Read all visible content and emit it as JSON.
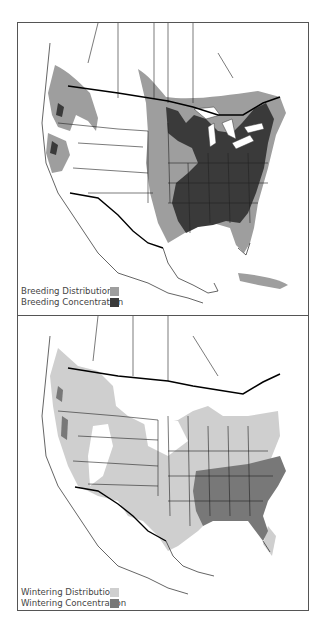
{
  "maps": [
    {
      "id": "breeding",
      "legend": [
        {
          "label": "Breeding Distribution",
          "color": "#9e9e9e"
        },
        {
          "label": "Breeding Concentration",
          "color": "#3a3a3a"
        }
      ]
    },
    {
      "id": "wintering",
      "legend": [
        {
          "label": "Wintering Distribution",
          "color": "#cfcfcf"
        },
        {
          "label": "Wintering Concentration",
          "color": "#787878"
        }
      ]
    }
  ]
}
